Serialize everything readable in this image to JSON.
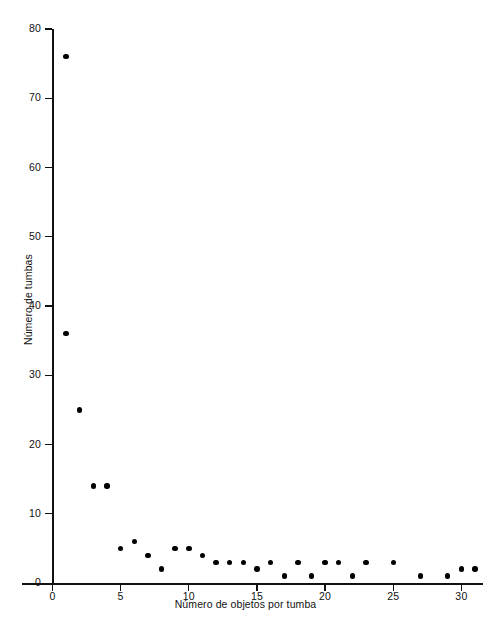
{
  "chart_data": {
    "type": "scatter",
    "title": "",
    "xlabel": "Número de objetos por tumba",
    "ylabel": "Número de tumbas",
    "xlim": [
      0,
      32
    ],
    "ylim": [
      0,
      80
    ],
    "grid": false,
    "legend": null,
    "xticks": [
      0,
      5,
      10,
      15,
      20,
      25,
      30
    ],
    "xticklabels": [
      "0",
      "5",
      "10",
      "15",
      "20",
      "25",
      "30"
    ],
    "yticks": [
      0,
      10,
      20,
      30,
      40,
      50,
      60,
      70,
      80
    ],
    "yticklabels": [
      "0",
      "10",
      "20",
      "30",
      "40",
      "50",
      "60",
      "70",
      "80"
    ],
    "marker": "filled-circle",
    "marker_color": "#000000",
    "points": [
      {
        "x": 1,
        "y": 76
      },
      {
        "x": 1,
        "y": 36
      },
      {
        "x": 2,
        "y": 25
      },
      {
        "x": 3,
        "y": 14
      },
      {
        "x": 4,
        "y": 14
      },
      {
        "x": 5,
        "y": 5
      },
      {
        "x": 6,
        "y": 6
      },
      {
        "x": 7,
        "y": 4
      },
      {
        "x": 8,
        "y": 2
      },
      {
        "x": 9,
        "y": 5
      },
      {
        "x": 10,
        "y": 5
      },
      {
        "x": 11,
        "y": 4
      },
      {
        "x": 12,
        "y": 3
      },
      {
        "x": 13,
        "y": 3
      },
      {
        "x": 14,
        "y": 3
      },
      {
        "x": 15,
        "y": 2
      },
      {
        "x": 16,
        "y": 3
      },
      {
        "x": 17,
        "y": 1
      },
      {
        "x": 18,
        "y": 3
      },
      {
        "x": 19,
        "y": 1
      },
      {
        "x": 20,
        "y": 3
      },
      {
        "x": 21,
        "y": 3
      },
      {
        "x": 22,
        "y": 1
      },
      {
        "x": 23,
        "y": 3
      },
      {
        "x": 25,
        "y": 3
      },
      {
        "x": 27,
        "y": 1
      },
      {
        "x": 29,
        "y": 1
      },
      {
        "x": 30,
        "y": 2
      },
      {
        "x": 31,
        "y": 2
      }
    ]
  },
  "axes": {
    "x_label": "Número de objetos por tumba",
    "y_label": "Número de tumbas"
  }
}
